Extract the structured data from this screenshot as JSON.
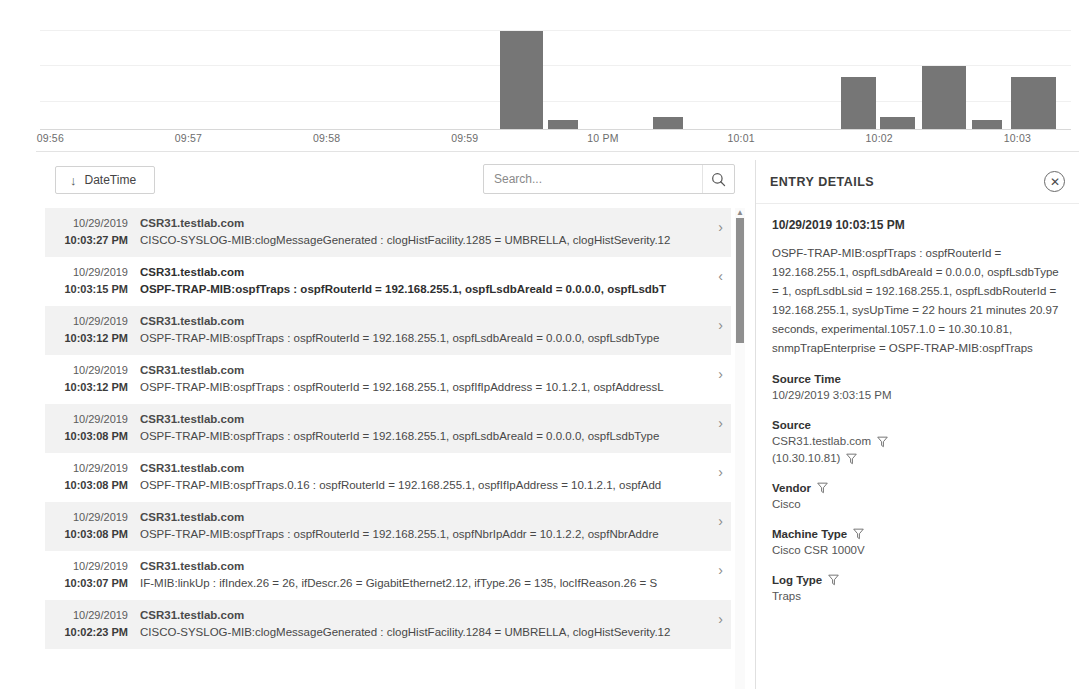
{
  "chart_data": {
    "type": "bar",
    "title": "",
    "xlabel": "",
    "ylabel": "",
    "grid": true,
    "legend": "none",
    "tick_labels": [
      "09:56",
      "09:57",
      "09:58",
      "09:59",
      "10 PM",
      "10:01",
      "10:02",
      "10:03"
    ],
    "tick_positions_pct": [
      1.0,
      14.4,
      27.8,
      41.2,
      54.6,
      68.0,
      81.4,
      94.8
    ],
    "ylim": [
      0,
      100
    ],
    "gridlines_pct": [
      15,
      45,
      75
    ],
    "bar_color": "#767676",
    "bars": [
      {
        "label": "09:59:40",
        "value": 83,
        "left_pct": 44.6,
        "width_pct": 4.2
      },
      {
        "label": "09:59:55",
        "value": 8,
        "left_pct": 49.3,
        "width_pct": 2.9
      },
      {
        "label": "10:00:50",
        "value": 10,
        "left_pct": 59.5,
        "width_pct": 2.9
      },
      {
        "label": "10:01:50",
        "value": 44,
        "left_pct": 77.7,
        "width_pct": 3.4
      },
      {
        "label": "10:02:05",
        "value": 10,
        "left_pct": 81.5,
        "width_pct": 3.4
      },
      {
        "label": "10:02:50",
        "value": 53,
        "left_pct": 85.5,
        "width_pct": 4.3
      },
      {
        "label": "10:03:05",
        "value": 8,
        "left_pct": 90.4,
        "width_pct": 2.9
      },
      {
        "label": "10:03:20",
        "value": 44,
        "left_pct": 94.2,
        "width_pct": 4.3
      }
    ]
  },
  "toolbar": {
    "datetime_label": "DateTime",
    "datetime_sort_arrow": "↓",
    "search_placeholder": "Search...",
    "search_value": ""
  },
  "list": {
    "rows": [
      {
        "date": "10/29/2019",
        "time": "10:03:27 PM",
        "host": "CSR31.testlab.com",
        "message": "CISCO-SYSLOG-MIB:clogMessageGenerated : clogHistFacility.1285 = UMBRELLA, clogHistSeverity.12",
        "chevron": "›",
        "selected": false
      },
      {
        "date": "10/29/2019",
        "time": "10:03:15 PM",
        "host": "CSR31.testlab.com",
        "message": "OSPF-TRAP-MIB:ospfTraps : ospfRouterId = 192.168.255.1, ospfLsdbAreaId = 0.0.0.0, ospfLsdbT",
        "chevron": "‹",
        "selected": true
      },
      {
        "date": "10/29/2019",
        "time": "10:03:12 PM",
        "host": "CSR31.testlab.com",
        "message": "OSPF-TRAP-MIB:ospfTraps : ospfRouterId = 192.168.255.1, ospfLsdbAreaId = 0.0.0.0, ospfLsdbType",
        "chevron": "›",
        "selected": false
      },
      {
        "date": "10/29/2019",
        "time": "10:03:12 PM",
        "host": "CSR31.testlab.com",
        "message": "OSPF-TRAP-MIB:ospfTraps : ospfRouterId = 192.168.255.1, ospfIfIpAddress = 10.1.2.1, ospfAddressL",
        "chevron": "›",
        "selected": false
      },
      {
        "date": "10/29/2019",
        "time": "10:03:08 PM",
        "host": "CSR31.testlab.com",
        "message": "OSPF-TRAP-MIB:ospfTraps : ospfRouterId = 192.168.255.1, ospfLsdbAreaId = 0.0.0.0, ospfLsdbType",
        "chevron": "›",
        "selected": false
      },
      {
        "date": "10/29/2019",
        "time": "10:03:08 PM",
        "host": "CSR31.testlab.com",
        "message": "OSPF-TRAP-MIB:ospfTraps.0.16 : ospfRouterId = 192.168.255.1, ospfIfIpAddress = 10.1.2.1, ospfAdd",
        "chevron": "›",
        "selected": false
      },
      {
        "date": "10/29/2019",
        "time": "10:03:08 PM",
        "host": "CSR31.testlab.com",
        "message": "OSPF-TRAP-MIB:ospfTraps : ospfRouterId = 192.168.255.1, ospfNbrIpAddr = 10.1.2.2, ospfNbrAddre",
        "chevron": "›",
        "selected": false
      },
      {
        "date": "10/29/2019",
        "time": "10:03:07 PM",
        "host": "CSR31.testlab.com",
        "message": "IF-MIB:linkUp : ifIndex.26 = 26, ifDescr.26 = GigabitEthernet2.12, ifType.26 = 135, locIfReason.26 = S",
        "chevron": "›",
        "selected": false
      },
      {
        "date": "10/29/2019",
        "time": "10:02:23 PM",
        "host": "CSR31.testlab.com",
        "message": "CISCO-SYSLOG-MIB:clogMessageGenerated : clogHistFacility.1284 = UMBRELLA, clogHistSeverity.12",
        "chevron": "›",
        "selected": false
      }
    ]
  },
  "details": {
    "title": "ENTRY DETAILS",
    "close_label": "✕",
    "timestamp": "10/29/2019 10:03:15 PM",
    "message": "OSPF-TRAP-MIB:ospfTraps : ospfRouterId = 192.168.255.1, ospfLsdbAreaId = 0.0.0.0, ospfLsdbType = 1, ospfLsdbLsid = 192.168.255.1, ospfLsdbRouterId = 192.168.255.1, sysUpTime = 22 hours 21 minutes 20.97 seconds, experimental.1057.1.0 = 10.30.10.81, snmpTrapEnterprise = OSPF-TRAP-MIB:ospfTraps",
    "fields": [
      {
        "label": "Source Time",
        "label_filter": false,
        "values": [
          {
            "text": "10/29/2019 3:03:15 PM",
            "filter": false
          }
        ]
      },
      {
        "label": "Source",
        "label_filter": false,
        "values": [
          {
            "text": "CSR31.testlab.com",
            "filter": true
          },
          {
            "text": "(10.30.10.81)",
            "filter": true
          }
        ]
      },
      {
        "label": "Vendor",
        "label_filter": true,
        "values": [
          {
            "text": "Cisco",
            "filter": false
          }
        ]
      },
      {
        "label": "Machine Type",
        "label_filter": true,
        "values": [
          {
            "text": "Cisco CSR 1000V",
            "filter": false
          }
        ]
      },
      {
        "label": "Log Type",
        "label_filter": true,
        "values": [
          {
            "text": "Traps",
            "filter": false
          }
        ]
      }
    ]
  }
}
